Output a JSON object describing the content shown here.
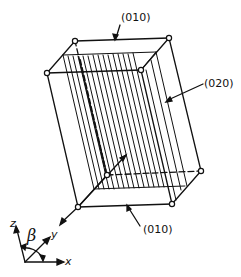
{
  "figure": {
    "type": "crystal-plane-schematic",
    "labels": {
      "top_plane": "(010)",
      "side_plane": "(020)",
      "bottom_plane": "(010)"
    },
    "axes": {
      "z": "z",
      "y": "y",
      "x": "x",
      "angle": "β"
    },
    "colors": {
      "line": "#111111",
      "background": "#ffffff"
    }
  }
}
